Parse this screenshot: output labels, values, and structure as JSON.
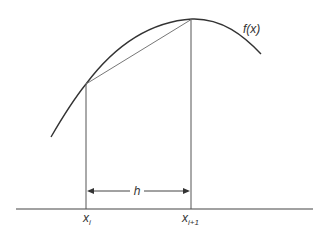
{
  "diagram": {
    "type": "trapezoidal-rule-illustration",
    "curve_label": "f(x)",
    "interval_label": "h",
    "left_point_label": {
      "base": "x",
      "sub": "i"
    },
    "right_point_label": {
      "base": "x",
      "sub": "i+1"
    },
    "colors": {
      "curve": "#333333",
      "chord": "#777777",
      "verticals": "#555555",
      "axis": "#444444",
      "text": "#333333"
    }
  }
}
